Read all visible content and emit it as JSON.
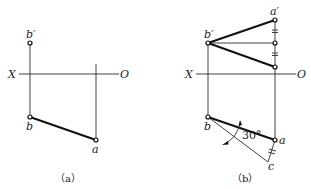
{
  "figure_a": {
    "caption": "（a）",
    "axis_x_label": "X",
    "axis_o_label": "O",
    "point_b_prime": "b′",
    "point_b": "b",
    "point_a": "a"
  },
  "figure_b": {
    "caption": "（b）",
    "axis_x_label": "X",
    "axis_o_label": "O",
    "point_b_prime": "b′",
    "point_a_prime": "a′",
    "point_b": "b",
    "point_a": "a",
    "point_c": "c",
    "angle_label": "30°"
  },
  "colors": {
    "line": "#111111",
    "background": "#ffffff"
  }
}
